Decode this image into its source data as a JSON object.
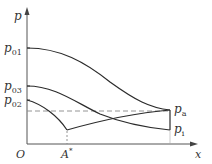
{
  "diagram": {
    "axes": {
      "y_label": "p",
      "x_label": "x",
      "origin_label": "O"
    },
    "y_ticks": [
      {
        "label": "p",
        "sub": "01",
        "y": 48
      },
      {
        "label": "p",
        "sub": "03",
        "y": 86
      },
      {
        "label": "p",
        "sub": "02",
        "y": 100
      }
    ],
    "x_marks": [
      {
        "label": "A",
        "sup": "*",
        "x": 67
      }
    ],
    "end_labels": [
      {
        "label": "p",
        "sub": "a",
        "y": 110
      },
      {
        "label": "p",
        "sub": "i",
        "y": 130
      }
    ],
    "colors": {
      "line": "#2b2b2b",
      "axis": "#555555",
      "dashed": "#888888"
    }
  }
}
